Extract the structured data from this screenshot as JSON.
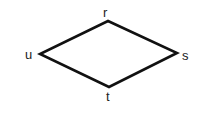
{
  "diagram": {
    "shape": "rhombus",
    "vertices": {
      "r": {
        "label": "r",
        "x": 108,
        "y": 21
      },
      "s": {
        "label": "s",
        "x": 177,
        "y": 53
      },
      "t": {
        "label": "t",
        "x": 109,
        "y": 87
      },
      "u": {
        "label": "u",
        "x": 40,
        "y": 54
      }
    },
    "stroke_color": "#111111"
  }
}
